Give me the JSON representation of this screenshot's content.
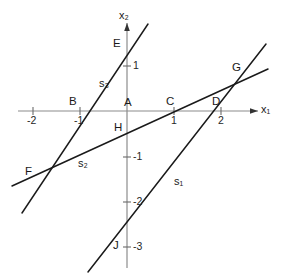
{
  "figure": {
    "type": "coordinate-geometry-diagram",
    "background_color": "#ffffff",
    "line_color": "#1a1a1a",
    "axis_color": "#8c8c8c",
    "text_color": "#1a1a1a"
  },
  "axes": {
    "x": {
      "name": "x",
      "subscript": "1",
      "label": "x₁",
      "arrow": true,
      "ticks": [
        {
          "label": "-2",
          "value": -2
        },
        {
          "label": "-1",
          "value": -1
        },
        {
          "label": "1",
          "value": 1
        },
        {
          "label": "2",
          "value": 2
        }
      ]
    },
    "y": {
      "name": "x",
      "subscript": "2",
      "label": "x₂",
      "arrow": true,
      "ticks": [
        {
          "label": "1",
          "value": 1
        },
        {
          "label": "-1",
          "value": -1
        },
        {
          "label": "-2",
          "value": -2
        },
        {
          "label": "-3",
          "value": -3
        }
      ]
    }
  },
  "points": [
    {
      "id": "A",
      "label": "A",
      "x": 0,
      "y": 0
    },
    {
      "id": "B",
      "label": "B",
      "x": -1,
      "y": 0
    },
    {
      "id": "C",
      "label": "C",
      "x": 1,
      "y": 0
    },
    {
      "id": "D",
      "label": "D",
      "x": 2,
      "y": 0
    },
    {
      "id": "E",
      "label": "E",
      "x": 0,
      "y": 2
    },
    {
      "id": "F",
      "label": "F",
      "x": -1.9,
      "y": -1.42
    },
    {
      "id": "G",
      "label": "G",
      "x": 2.35,
      "y": 0.75
    },
    {
      "id": "H",
      "label": "H",
      "x": 0,
      "y": -0.45
    },
    {
      "id": "J",
      "label": "J",
      "x": 0,
      "y": -3
    }
  ],
  "lines": [
    {
      "id": "s1",
      "name": "s",
      "subscript": "1",
      "label": "s₁",
      "through": [
        "J",
        "D",
        "G"
      ],
      "slope": 1.5,
      "intercept": -3
    },
    {
      "id": "s2",
      "name": "s",
      "subscript": "2",
      "label": "s₂",
      "through": [
        "F",
        "H",
        "C",
        "G"
      ],
      "slope": 0.45,
      "intercept": -0.45
    },
    {
      "id": "s3",
      "name": "s",
      "subscript": "3",
      "label": "s₃",
      "through": [
        "F",
        "B",
        "E"
      ],
      "slope": 2.0,
      "intercept": 2
    }
  ]
}
